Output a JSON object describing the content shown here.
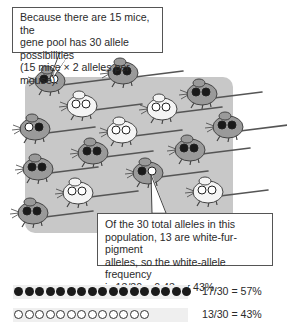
{
  "callouts": {
    "top": {
      "lines": [
        "Because there are 15 mice, the",
        "gene pool has 30 allele possibilities",
        "(15 mice × 2 alleles per mouse)."
      ]
    },
    "bottom": {
      "lines": [
        "Of the 30 total alleles in this",
        "population, 13 are white-fur-pigment",
        "alleles, so the white-allele frequency",
        "is 13/30 = 0.43, or 43%."
      ]
    }
  },
  "colors": {
    "panel": "#c8c8c8",
    "dark_fur": "#9a9a9a",
    "white_fur": "#f4f4f4",
    "dark_allele": "#1a1a1a",
    "white_allele": "#ffffff"
  },
  "mice": [
    {
      "fur": "dark",
      "alleles": [
        "dark",
        "white"
      ]
    },
    {
      "fur": "dark",
      "alleles": [
        "dark",
        "dark"
      ]
    },
    {
      "fur": "dark",
      "alleles": [
        "dark",
        "dark"
      ]
    },
    {
      "fur": "white",
      "alleles": [
        "white",
        "white"
      ]
    },
    {
      "fur": "white",
      "alleles": [
        "white",
        "white"
      ]
    },
    {
      "fur": "dark",
      "alleles": [
        "white",
        "dark"
      ]
    },
    {
      "fur": "white",
      "alleles": [
        "white",
        "white"
      ]
    },
    {
      "fur": "dark",
      "alleles": [
        "dark",
        "dark"
      ]
    },
    {
      "fur": "dark",
      "alleles": [
        "dark",
        "dark"
      ]
    },
    {
      "fur": "dark",
      "alleles": [
        "dark",
        "dark"
      ]
    },
    {
      "fur": "dark",
      "alleles": [
        "dark",
        "dark"
      ]
    },
    {
      "fur": "dark",
      "alleles": [
        "dark",
        "white"
      ]
    },
    {
      "fur": "white",
      "alleles": [
        "white",
        "white"
      ]
    },
    {
      "fur": "white",
      "alleles": [
        "white",
        "white"
      ]
    },
    {
      "fur": "dark",
      "alleles": [
        "dark",
        "dark"
      ]
    }
  ],
  "summary": {
    "rows": [
      {
        "allele": "dark",
        "count": 17,
        "total": 30,
        "label": "17/30 = 57%"
      },
      {
        "allele": "white",
        "count": 13,
        "total": 30,
        "label": "13/30 = 43%"
      }
    ]
  }
}
